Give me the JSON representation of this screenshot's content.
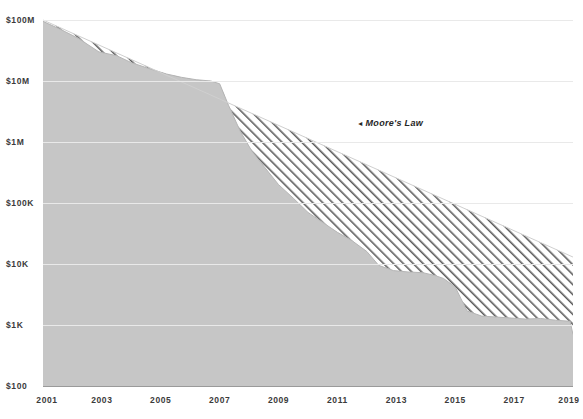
{
  "chart_data": {
    "type": "area",
    "title": "",
    "subtitle": "",
    "xlabel": "",
    "ylabel": "",
    "scale": "log",
    "grid": true,
    "legend_position": "inline-annotation",
    "xlim": [
      2001,
      2019
    ],
    "ylim": [
      100,
      100000000
    ],
    "x_ticks": [
      "2001",
      "2003",
      "2005",
      "2007",
      "2009",
      "2011",
      "2013",
      "2015",
      "2017",
      "2019"
    ],
    "x_tick_values": [
      2001,
      2003,
      2005,
      2007,
      2009,
      2011,
      2013,
      2015,
      2017,
      2019
    ],
    "y_ticks": [
      "$100M",
      "$10M",
      "$1M",
      "$100K",
      "$10K",
      "$1K",
      "$100"
    ],
    "y_tick_values": [
      100000000,
      10000000,
      1000000,
      100000,
      10000,
      1000,
      100
    ],
    "annotations": [
      {
        "text": "Moore's Law",
        "marker": "◂",
        "x": 2013.2,
        "y": 1900000
      }
    ],
    "colors": {
      "area_fill": "#c6c6c6",
      "hatch_stroke": "#5a5a5a",
      "gridline": "#e9e9e9",
      "axis_line": "#9a9a9a",
      "text": "#3b3b3b",
      "background": "#ffffff"
    },
    "series": [
      {
        "name": "Cost per genome",
        "type": "area",
        "x": [
          2001,
          2001.6,
          2002.2,
          2002.9,
          2003.5,
          2004.0,
          2004.6,
          2005.2,
          2005.7,
          2006.2,
          2006.7,
          2007.0,
          2007.3,
          2007.7,
          2008.1,
          2008.5,
          2009.0,
          2009.5,
          2010.0,
          2010.5,
          2011.0,
          2011.5,
          2012.0,
          2012.4,
          2012.9,
          2013.4,
          2013.9,
          2014.3,
          2014.6,
          2015.0,
          2015.4,
          2015.9,
          2016.4,
          2016.9,
          2017.4,
          2017.9,
          2018.4,
          2018.9,
          2019.0
        ],
        "y": [
          95000000,
          70000000,
          50000000,
          30000000,
          26000000,
          20000000,
          16000000,
          13000000,
          11500000,
          10500000,
          10000000,
          9000000,
          4000000,
          1500000,
          700000,
          400000,
          200000,
          120000,
          70000,
          48000,
          33000,
          24000,
          16000,
          9500,
          7800,
          7400,
          7200,
          6500,
          5800,
          4200,
          1700,
          1400,
          1350,
          1300,
          1250,
          1280,
          1200,
          1150,
          700
        ]
      },
      {
        "name": "Moore's Law",
        "type": "line",
        "x": [
          2001,
          2019
        ],
        "y": [
          100000000,
          13000
        ]
      }
    ]
  },
  "axis": {
    "y_unit_note": "logarithmic dollars",
    "x_unit_note": "year"
  }
}
